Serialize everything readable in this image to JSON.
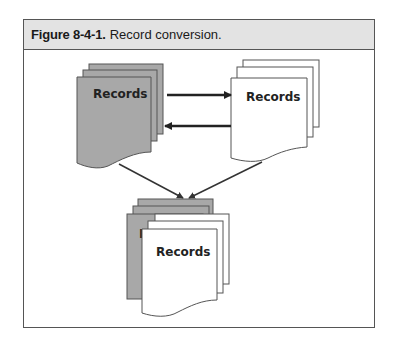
{
  "figure": {
    "number": "Figure 8-4-1.",
    "caption": "Record conversion."
  },
  "diagram": {
    "source_stack": {
      "label": "Records",
      "fill": "#a8a8a8"
    },
    "target_stack": {
      "label": "Records",
      "fill": "#ffffff"
    },
    "merged_stack": {
      "label": "Records",
      "hidden_label_fragment": "R"
    },
    "colors": {
      "gray_page": "#a8a8a8",
      "white_page": "#ffffff",
      "stroke": "#444444",
      "arrow": "#222222",
      "title_bar": "#e3e3e3"
    },
    "arrows": [
      {
        "from": "source_stack",
        "to": "target_stack",
        "direction": "right"
      },
      {
        "from": "target_stack",
        "to": "source_stack",
        "direction": "left"
      },
      {
        "from": "source_stack",
        "to": "merged_stack",
        "direction": "down"
      },
      {
        "from": "target_stack",
        "to": "merged_stack",
        "direction": "down"
      }
    ]
  }
}
